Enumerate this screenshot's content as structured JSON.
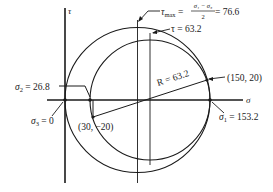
{
  "diagram": {
    "axes": {
      "horizontal_label": "σ",
      "vertical_label": "τ"
    },
    "points": {
      "point_a": "(150, 20)",
      "point_b": "(30, −20)"
    },
    "annotations": {
      "sigma1": {
        "symbol": "σ",
        "sub": "1",
        "eq": " = 153.2"
      },
      "sigma2": {
        "symbol": "σ",
        "sub": "2",
        "eq": " = 26.8"
      },
      "sigma3": {
        "symbol": "σ",
        "sub": "3",
        "eq": " = 0"
      },
      "radius": "R = 63.2",
      "tau": "τ = 63.2",
      "tau_max": {
        "symbol": "τ",
        "sub": "max",
        "eq1": " = ",
        "numerator": "σ₁ − σ₃",
        "denominator": "2",
        "eq2": " = 76.6"
      }
    }
  }
}
